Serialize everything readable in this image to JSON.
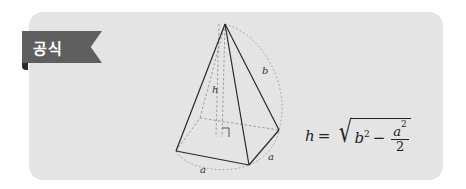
{
  "tab": {
    "label": "공식",
    "color": "#5f5f5f"
  },
  "card": {
    "background": "#e4e4e4"
  },
  "diagram": {
    "type": "square-pyramid",
    "labels": {
      "height": "h",
      "lateral_edge": "b",
      "base_edge_front": "a",
      "base_edge_right": "a"
    },
    "right_angle_marker": true
  },
  "formula": {
    "lhs": "h",
    "equals": "=",
    "b": "b",
    "b_exp": "2",
    "minus": "−",
    "num": "a",
    "num_exp": "2",
    "den": "2",
    "text": "h = √(b² − a²/2)"
  }
}
